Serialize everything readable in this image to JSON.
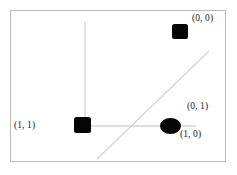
{
  "figure": {
    "background_color": "#ffffff",
    "frame": {
      "border_color": "#b9b9b9",
      "x": 10,
      "y": 10,
      "width": 216,
      "height": 152
    },
    "edge_color": "#d4d4d4",
    "node_color": "#050505",
    "label_color": "#1b1b1b"
  },
  "chart_data": {
    "type": "scatter",
    "title": "",
    "xlabel": "",
    "ylabel": "",
    "grid": false,
    "legend": "none",
    "nodes": [
      {
        "id": "node-top-right",
        "label": "(0, 0)",
        "shape": "square",
        "x": 180,
        "y": 31,
        "w": 16,
        "h": 15,
        "label_x": 192,
        "label_y": 13
      },
      {
        "id": "node-center",
        "label": "(1, 1)",
        "shape": "square",
        "x": 82,
        "y": 125,
        "w": 17,
        "h": 16,
        "label_x": 14,
        "label_y": 120
      },
      {
        "id": "node-right",
        "label": "(0, 1)",
        "shape": "ellipse",
        "x": 170,
        "y": 126,
        "w": 21,
        "h": 16,
        "label_x": 187,
        "label_y": 101
      },
      {
        "id": "node-right-second-label",
        "label": "(1, 0)",
        "shape": "none",
        "x": 0,
        "y": 0,
        "w": 0,
        "h": 0,
        "label_x": 180,
        "label_y": 129
      }
    ],
    "edges": [
      {
        "id": "edge-vertical",
        "x1": 85,
        "y1": 22,
        "x2": 85,
        "y2": 126
      },
      {
        "id": "edge-horizontal",
        "x1": 86,
        "y1": 126,
        "x2": 196,
        "y2": 126
      },
      {
        "id": "edge-diagonal",
        "x1": 97,
        "y1": 159,
        "x2": 209,
        "y2": 51
      }
    ]
  },
  "labels": {
    "top_right": "(0, 0)",
    "left": "(1, 1)",
    "right_upper": "(0, 1)",
    "right_lower": "(1, 0)"
  }
}
